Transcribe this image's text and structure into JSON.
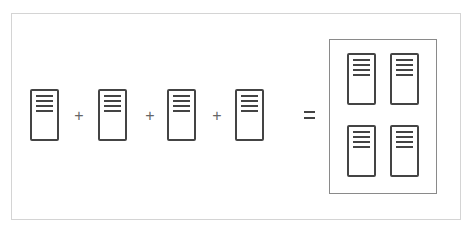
{
  "diagram": {
    "title": "",
    "inputs": [
      {
        "icon": "server-icon"
      },
      {
        "icon": "server-icon"
      },
      {
        "icon": "server-icon"
      },
      {
        "icon": "server-icon"
      }
    ],
    "operators": [
      "+",
      "+",
      "+"
    ],
    "equals": "=",
    "result": {
      "icon": "server-cluster",
      "servers": [
        {
          "icon": "server-icon"
        },
        {
          "icon": "server-icon"
        },
        {
          "icon": "server-icon"
        },
        {
          "icon": "server-icon"
        }
      ]
    },
    "colors": {
      "stroke": "#444444",
      "operator": "#666666",
      "frame": "#d4d4d4",
      "cluster_border": "#8a8a8a",
      "background": "#ffffff"
    }
  }
}
